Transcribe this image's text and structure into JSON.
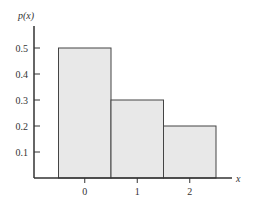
{
  "chart_data": {
    "type": "bar",
    "title": "",
    "xlabel": "x",
    "ylabel": "p(x)",
    "categories": [
      "0",
      "1",
      "2"
    ],
    "values": [
      0.5,
      0.3,
      0.2
    ],
    "yticks": [
      "0.1",
      "0.2",
      "0.3",
      "0.4",
      "0.5"
    ],
    "ylim": [
      0,
      0.58
    ],
    "grid": false,
    "legend": null,
    "bar_color": "#e8e8e8",
    "edge_color": "#444444"
  }
}
